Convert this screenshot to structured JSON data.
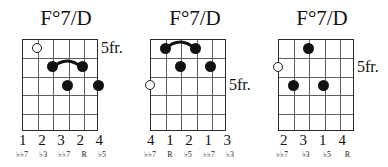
{
  "page": {
    "background_color": "#ffffff",
    "ink_color": "#111111",
    "grid_color": "#5d5d5d"
  },
  "diagrams": [
    {
      "title": "F°7/D",
      "position_label": "5fr.",
      "position_fret_row": 1,
      "strings": 6,
      "frets": 5,
      "open_strings": [
        {
          "string": 2,
          "fret": 1
        }
      ],
      "dots": [
        {
          "string": 3,
          "fret": 2
        },
        {
          "string": 5,
          "fret": 2
        },
        {
          "string": 4,
          "fret": 3
        },
        {
          "string": 6,
          "fret": 3
        }
      ],
      "barres": [
        {
          "fret": 2,
          "from_string": 3,
          "to_string": 5
        }
      ],
      "fingers": [
        "1",
        "2",
        "3",
        "2",
        "4"
      ],
      "intervals": [
        "♭♭7",
        "♭3",
        "♭♭7",
        "R",
        "♭5"
      ]
    },
    {
      "title": "F°7/D",
      "position_label": "5fr.",
      "position_fret_row": 3,
      "strings": 6,
      "frets": 5,
      "open_strings": [
        {
          "string": 1,
          "fret": 3
        }
      ],
      "dots": [
        {
          "string": 2,
          "fret": 1
        },
        {
          "string": 4,
          "fret": 1
        },
        {
          "string": 3,
          "fret": 2
        },
        {
          "string": 5,
          "fret": 2
        }
      ],
      "barres": [
        {
          "fret": 1,
          "from_string": 2,
          "to_string": 4
        }
      ],
      "fingers": [
        "4",
        "1",
        "2",
        "1",
        "3"
      ],
      "intervals": [
        "♭♭7",
        "R",
        "♭5",
        "♭♭7",
        "♭3"
      ]
    },
    {
      "title": "F°7/D",
      "position_label": "5fr.",
      "position_fret_row": 2,
      "strings": 6,
      "frets": 5,
      "open_strings": [
        {
          "string": 1,
          "fret": 2
        }
      ],
      "dots": [
        {
          "string": 3,
          "fret": 1
        },
        {
          "string": 2,
          "fret": 3
        },
        {
          "string": 4,
          "fret": 3
        }
      ],
      "barres": [],
      "fingers": [
        "2",
        "3",
        "1",
        "4"
      ],
      "intervals": [
        "♭♭7",
        "♭3",
        "♭5",
        "R"
      ]
    }
  ],
  "layout": {
    "cards": [
      {
        "left": 0,
        "width": 132,
        "board_left": 22,
        "board_top": 39,
        "board_width": 76,
        "board_height": 92,
        "label_left": 101,
        "fingers_left": 19,
        "fingers_width": 84,
        "intervals_left": 16,
        "intervals_width": 90
      },
      {
        "left": 129,
        "width": 132,
        "board_left": 21,
        "board_top": 39,
        "board_width": 76,
        "board_height": 92,
        "label_left": 100,
        "fingers_left": 18,
        "fingers_width": 84,
        "intervals_left": 15,
        "intervals_width": 90
      },
      {
        "left": 256,
        "width": 132,
        "board_left": 22,
        "board_top": 39,
        "board_width": 76,
        "board_height": 92,
        "label_left": 101,
        "fingers_left": 24,
        "fingers_width": 66,
        "intervals_left": 20,
        "intervals_width": 74
      }
    ],
    "fingers_top": 132,
    "intervals_top": 150
  }
}
